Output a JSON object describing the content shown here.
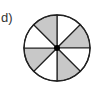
{
  "label": "d)",
  "circle": {
    "cx": 57,
    "cy": 48,
    "r": 33,
    "sectors": 8,
    "shaded_color": "#c8c8c8",
    "unshaded_color": "#ffffff",
    "stroke_color": "#222222",
    "shaded_pattern": [
      false,
      true,
      false,
      true,
      false,
      true,
      false,
      true
    ]
  }
}
